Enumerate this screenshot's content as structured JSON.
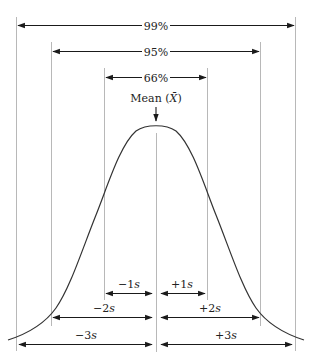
{
  "diagram": {
    "mean_label_prefix": "Mean (",
    "mean_symbol": "X̄",
    "mean_label_suffix": ")",
    "ranges": [
      {
        "label": "99%",
        "span": "±3s"
      },
      {
        "label": "95%",
        "span": "±2s"
      },
      {
        "label": "66%",
        "span": "±1s"
      }
    ],
    "sd_labels": {
      "minus1": {
        "sign": "−1",
        "unit": "s"
      },
      "plus1": {
        "sign": "+1",
        "unit": "s"
      },
      "minus2": {
        "sign": "−2",
        "unit": "s"
      },
      "plus2": {
        "sign": "+2",
        "unit": "s"
      },
      "minus3": {
        "sign": "−3",
        "unit": "s"
      },
      "plus3": {
        "sign": "+3",
        "unit": "s"
      }
    },
    "colors": {
      "guide_line": "#b8b8b8",
      "arrow": "#1a1a1a",
      "curve": "#333333"
    }
  }
}
